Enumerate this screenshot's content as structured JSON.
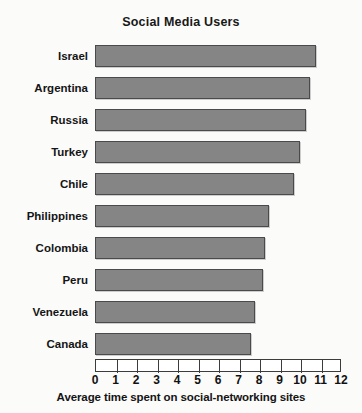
{
  "chart_data": {
    "type": "bar",
    "orientation": "horizontal",
    "title": "Social Media Users",
    "xlabel": "Average time spent on social-networking sites",
    "ylabel": "",
    "xlim": [
      0,
      12
    ],
    "xticks": [
      "0",
      "1",
      "2",
      "3",
      "4",
      "5",
      "6",
      "7",
      "8",
      "9",
      "10",
      "11",
      "12"
    ],
    "grid": false,
    "legend": null,
    "bar_color": "#858585",
    "bar_edge_color": "#4a4a4a",
    "categories": [
      "Israel",
      "Argentina",
      "Russia",
      "Turkey",
      "Chile",
      "Philippines",
      "Colombia",
      "Peru",
      "Venezuela",
      "Canada"
    ],
    "values": [
      10.8,
      10.5,
      10.3,
      10.0,
      9.7,
      8.5,
      8.3,
      8.2,
      7.8,
      7.6
    ]
  }
}
